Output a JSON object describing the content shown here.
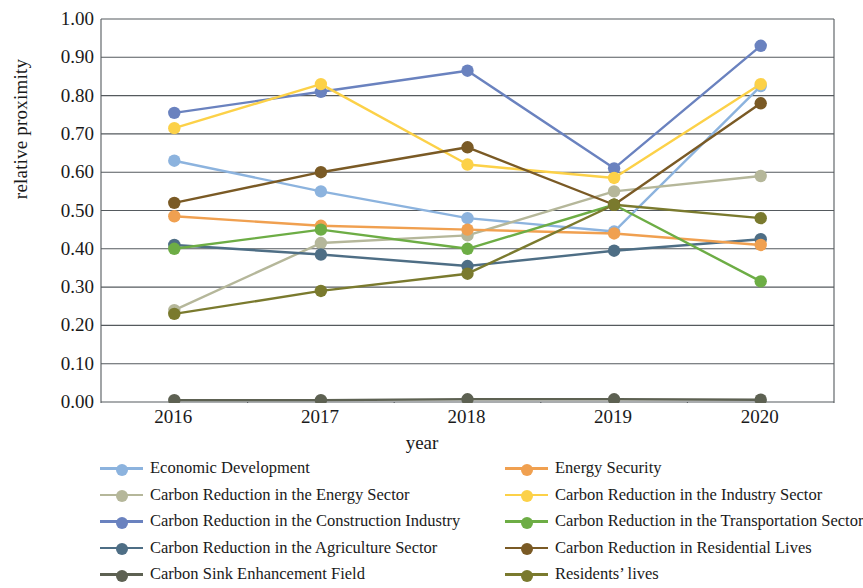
{
  "chart_data": {
    "type": "line",
    "title": "",
    "xlabel": "year",
    "ylabel": "relative proximity",
    "categories": [
      "2016",
      "2017",
      "2018",
      "2019",
      "2020"
    ],
    "x": [
      2016,
      2017,
      2018,
      2019,
      2020
    ],
    "ylim": [
      0.0,
      1.0
    ],
    "ytick_labels": [
      "0.00",
      "0.10",
      "0.20",
      "0.30",
      "0.40",
      "0.50",
      "0.60",
      "0.70",
      "0.80",
      "0.90",
      "1.00"
    ],
    "ytick_values": [
      0.0,
      0.1,
      0.2,
      0.3,
      0.4,
      0.5,
      0.6,
      0.7,
      0.8,
      0.9,
      1.0
    ],
    "grid": true,
    "legend_position": "bottom",
    "legend_columns": 2,
    "series": [
      {
        "name": "Economic Development",
        "color": "#8cb3de",
        "values": [
          0.63,
          0.55,
          0.48,
          0.445,
          0.825
        ]
      },
      {
        "name": "Carbon Reduction in the Energy Sector",
        "color": "#b5b79a",
        "values": [
          0.24,
          0.415,
          0.435,
          0.55,
          0.59
        ]
      },
      {
        "name": "Carbon Reduction in the Construction Industry",
        "color": "#6a82bf",
        "values": [
          0.755,
          0.81,
          0.865,
          0.61,
          0.93
        ]
      },
      {
        "name": "Carbon Reduction in the Agriculture Sector",
        "color": "#4e6e85",
        "values": [
          0.41,
          0.385,
          0.355,
          0.395,
          0.425
        ]
      },
      {
        "name": "Carbon Sink Enhancement Field",
        "color": "#5d6152",
        "values": [
          0.005,
          0.005,
          0.007,
          0.007,
          0.006
        ]
      },
      {
        "name": "Energy Security",
        "color": "#f0a050",
        "values": [
          0.485,
          0.46,
          0.45,
          0.44,
          0.41
        ]
      },
      {
        "name": "Carbon Reduction in the Industry Sector",
        "color": "#fcd148",
        "values": [
          0.715,
          0.83,
          0.62,
          0.585,
          0.83
        ]
      },
      {
        "name": "Carbon Reduction in the Transportation Sector",
        "color": "#6dad45",
        "values": [
          0.4,
          0.45,
          0.4,
          0.515,
          0.315
        ]
      },
      {
        "name": "Carbon Reduction in Residential Lives",
        "color": "#7a5a25",
        "values": [
          0.52,
          0.6,
          0.665,
          0.515,
          0.78
        ]
      },
      {
        "name": "Residents’ lives",
        "color": "#7a7a2e",
        "values": [
          0.23,
          0.29,
          0.335,
          0.515,
          0.48
        ]
      }
    ]
  },
  "axes": {
    "ylabel": "relative proximity",
    "xlabel": "year"
  }
}
